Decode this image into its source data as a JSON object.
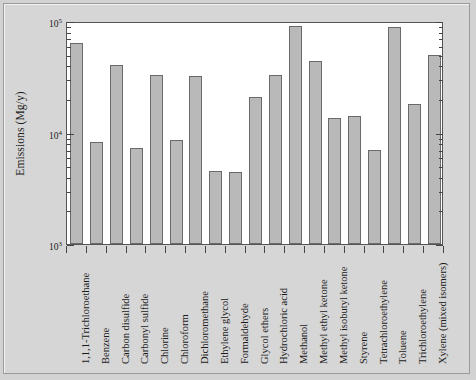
{
  "figure": {
    "background_color": "#d4d4d4",
    "plot_background_color": "#ffffff",
    "bar_fill_color": "#b9b9b9",
    "bar_edge_color": "#6a6a6a",
    "axis_color": "#444444"
  },
  "axes": {
    "ylabel": "Emissions (Mg/y)",
    "ytick_labels": [
      "10",
      "10",
      "10"
    ],
    "ytick_exponents": [
      "5",
      "4",
      "3"
    ],
    "ytick_values": [
      100000,
      10000,
      1000
    ]
  },
  "chart_data": {
    "type": "bar",
    "title": "",
    "xlabel": "",
    "ylabel": "Emissions (Mg/y)",
    "yscale": "log",
    "ylim": [
      1000,
      100000
    ],
    "grid": false,
    "legend": false,
    "ytick_labels": [
      "10^3",
      "10^4",
      "10^5"
    ],
    "categories": [
      "1,1,1-Trichloroethane",
      "Benzene",
      "Carbon disulfide",
      "Carbonyl sulfide",
      "Chlorine",
      "Chloroform",
      "Dichloromethane",
      "Ethylene glycol",
      "Formaldehyde",
      "Glycol ethers",
      "Hydrochloric acid",
      "Methanol",
      "Methyl ethyl ketone",
      "Methyl isobutyl ketone",
      "Styrene",
      "Tetrachloroethylene",
      "Toluene",
      "Trichloroethylene",
      "Xylene (mixed isomers)"
    ],
    "values": [
      63000,
      8300,
      40000,
      7200,
      33000,
      8600,
      32000,
      4500,
      4400,
      21000,
      33000,
      90000,
      44000,
      13500,
      14000,
      7000,
      89000,
      18000,
      50000
    ]
  }
}
